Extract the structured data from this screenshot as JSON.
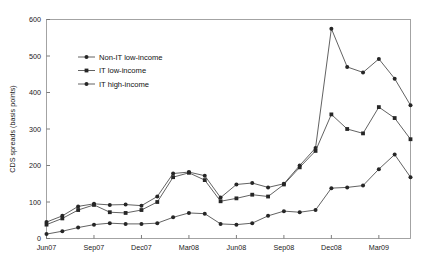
{
  "chart_data": {
    "type": "line",
    "title": "",
    "xlabel": "",
    "ylabel": "CDS spreads (basis points)",
    "ylim": [
      0,
      600
    ],
    "ytick_values": [
      0,
      100,
      200,
      300,
      400,
      500,
      600
    ],
    "ytick_labels": [
      "0",
      "100",
      "200",
      "300",
      "400",
      "500",
      "600"
    ],
    "grid": false,
    "legend_position": "upper-left-inside",
    "x": [
      "Jun07",
      "Jul07",
      "Aug07",
      "Sep07",
      "Oct07",
      "Nov07",
      "Dec07",
      "Jan08",
      "Feb08",
      "Mar08",
      "Apr08",
      "May08",
      "Jun08",
      "Jul08",
      "Aug08",
      "Sep08",
      "Oct08",
      "Nov08",
      "Dec08",
      "Jan09",
      "Feb09",
      "Mar09",
      "Apr09",
      "May09"
    ],
    "xtick_labels": [
      "Jun07",
      "Sep07",
      "Dec07",
      "Mar08",
      "Jun08",
      "Sep08",
      "Dec08",
      "Mar09"
    ],
    "xtick_indices": [
      0,
      3,
      6,
      9,
      12,
      15,
      18,
      21
    ],
    "series": [
      {
        "name": "Non-IT low-income",
        "marker": "filled-circle",
        "color": "#262626",
        "values": [
          45,
          62,
          88,
          95,
          92,
          93,
          90,
          115,
          178,
          182,
          172,
          112,
          148,
          152,
          140,
          150,
          200,
          248,
          575,
          470,
          455,
          492,
          438,
          365
        ]
      },
      {
        "name": "IT low-income",
        "marker": "filled-square",
        "color": "#262626",
        "values": [
          38,
          55,
          78,
          92,
          72,
          70,
          78,
          100,
          168,
          180,
          160,
          102,
          110,
          120,
          115,
          148,
          195,
          240,
          340,
          300,
          288,
          360,
          330,
          272
        ]
      },
      {
        "name": "IT high-income",
        "marker": "filled-circle",
        "color": "#262626",
        "values": [
          12,
          20,
          30,
          38,
          42,
          40,
          40,
          42,
          58,
          70,
          68,
          40,
          38,
          42,
          62,
          75,
          72,
          78,
          138,
          140,
          145,
          190,
          230,
          168
        ]
      }
    ]
  }
}
